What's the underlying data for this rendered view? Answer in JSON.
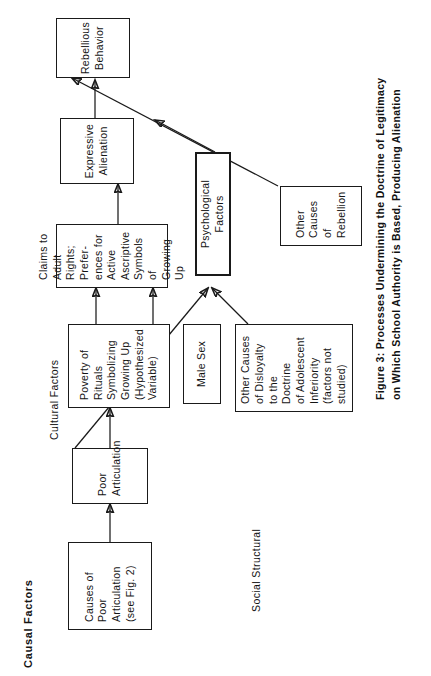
{
  "figure": {
    "caption": "Figure 3:  Processes Undermining the Doctrine of Legitimacy\non Which School Authority is Based, Producing Alienation"
  },
  "section_labels": {
    "causal_factors": "Causal Factors",
    "social_structural": "Social Structural",
    "cultural_factors": "Cultural Factors"
  },
  "nodes": {
    "causes_poor_articulation": "Causes of\nPoor Articulation\n(see Fig. 2)",
    "poor_articulation": "Poor\nArticulation",
    "poverty_of_rituals": "Poverty of\nRituals\nSymbolizing\nGrowing Up\n(Hypothesized\nVariable)",
    "male_sex": "Male Sex",
    "other_causes_disloyalty": "Other Causes\nof Disloyalty\nto the Doctrine\nof Adolescent\nInferiority\n(factors not\nstudied)",
    "claims_to_adult_rights": "Claims to Adult\nRights; Prefer-\nences for Active\nAscriptive\nSymbols of\nGrowing Up",
    "psychological_factors": "Psychological Factors",
    "expressive_alienation": "Expressive\nAlienation",
    "other_causes_rebellion": "Other\nCauses\nof\nRebellion",
    "rebellious_behavior": "Rebellious\nBehavior"
  },
  "colors": {
    "ink": "#1a1a1a",
    "paper": "#ffffff"
  }
}
